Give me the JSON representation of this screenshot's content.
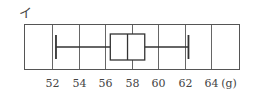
{
  "figure_label": "イ",
  "unit": "(g)",
  "chart_data": {
    "type": "boxplot",
    "title": "",
    "label": "イ",
    "xlabel": "(g)",
    "ylabel": "",
    "xlim": [
      50,
      66
    ],
    "grid": true,
    "ticks": [
      52,
      54,
      56,
      58,
      60,
      62,
      64
    ],
    "tick_labels": [
      "52",
      "54",
      "56",
      "58",
      "60",
      "62",
      "64"
    ],
    "box": {
      "min": 52.3,
      "q1": 56.4,
      "median": 57.7,
      "q3": 59.0,
      "max": 62.3
    }
  },
  "colors": {
    "frame": "#555555",
    "grid": "#666666",
    "box": "#333333"
  }
}
